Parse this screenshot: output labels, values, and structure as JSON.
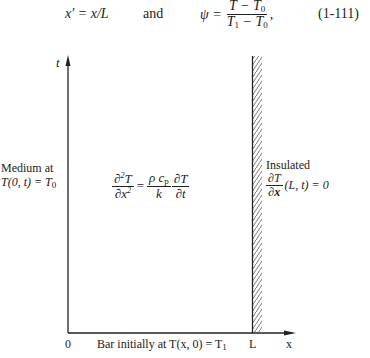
{
  "header_equation": {
    "left": "x′ = x/L",
    "connector": "and",
    "psi": "ψ =",
    "num": "T − T",
    "num_sub": "0",
    "den_a": "T",
    "den_a_sub": "1",
    "den_b": " − T",
    "den_b_sub": "0",
    "trail": ",",
    "number": "(1-111)"
  },
  "axes": {
    "t_label": "t",
    "x_label": "x",
    "origin_label": "0",
    "L_label": "L"
  },
  "left_boundary": {
    "line1": "Medium at",
    "line2": "T(0, t) = T",
    "line2_sub": "0"
  },
  "pde": {
    "lhs_num": "∂",
    "lhs_num_sup": "2",
    "lhs_num_var": "T",
    "lhs_den": "∂x",
    "lhs_den_sup": "2",
    "eq": "=",
    "coef_num": "ρ c",
    "coef_num_sub": "p",
    "coef_den": "k",
    "rhs_num": "∂T",
    "rhs_den": "∂t"
  },
  "right_boundary": {
    "line1": "Insulated",
    "frac_num": "∂T",
    "frac_den": "∂x",
    "rest": "(L, t) = 0"
  },
  "bottom_caption": {
    "text": "Bar initially at T(x, 0) = T",
    "sub": "1"
  }
}
